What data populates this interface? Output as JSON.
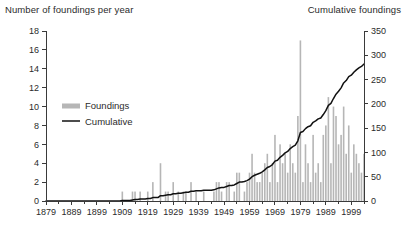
{
  "header": {
    "left_title": "Number of foundings per year",
    "right_title": "Cumulative foundings"
  },
  "legend": {
    "items": [
      {
        "label": "Foundings",
        "type": "bar",
        "color": "#b6b6b6"
      },
      {
        "label": "Cumulative",
        "type": "line",
        "color": "#111111"
      }
    ]
  },
  "chart_data": {
    "type": "bar",
    "title": "",
    "subtitle": "",
    "xlabel": "",
    "ylabel": "Number of foundings per year",
    "y2label": "Cumulative foundings",
    "grid": false,
    "legend_position": "inside-left",
    "ylim": [
      0,
      18
    ],
    "y2lim": [
      0,
      350
    ],
    "yticks": [
      0,
      2,
      4,
      6,
      8,
      10,
      12,
      14,
      16,
      18
    ],
    "ytick_labels": [
      "0",
      "2",
      "4",
      "6",
      "8",
      "10",
      "12",
      "14",
      "16",
      "18"
    ],
    "y2ticks": [
      0,
      50,
      100,
      150,
      200,
      250,
      300,
      350
    ],
    "y2tick_labels": [
      "0",
      "50",
      "100",
      "150",
      "200",
      "250",
      "300",
      "350"
    ],
    "xlim": [
      1879,
      2004
    ],
    "xticks": [
      1879,
      1889,
      1899,
      1909,
      1919,
      1929,
      1939,
      1949,
      1959,
      1969,
      1979,
      1989,
      1999
    ],
    "xtick_labels": [
      "1879",
      "1889",
      "1899",
      "1909",
      "1919",
      "1929",
      "1939",
      "1949",
      "1959",
      "1969",
      "1979",
      "1989",
      "1999"
    ],
    "minor_xtick_step": 5,
    "x": [
      1879,
      1880,
      1881,
      1882,
      1883,
      1884,
      1885,
      1886,
      1887,
      1888,
      1889,
      1890,
      1891,
      1892,
      1893,
      1894,
      1895,
      1896,
      1897,
      1898,
      1899,
      1900,
      1901,
      1902,
      1903,
      1904,
      1905,
      1906,
      1907,
      1908,
      1909,
      1910,
      1911,
      1912,
      1913,
      1914,
      1915,
      1916,
      1917,
      1918,
      1919,
      1920,
      1921,
      1922,
      1923,
      1924,
      1925,
      1926,
      1927,
      1928,
      1929,
      1930,
      1931,
      1932,
      1933,
      1934,
      1935,
      1936,
      1937,
      1938,
      1939,
      1940,
      1941,
      1942,
      1943,
      1944,
      1945,
      1946,
      1947,
      1948,
      1949,
      1950,
      1951,
      1952,
      1953,
      1954,
      1955,
      1956,
      1957,
      1958,
      1959,
      1960,
      1961,
      1962,
      1963,
      1964,
      1965,
      1966,
      1967,
      1968,
      1969,
      1970,
      1971,
      1972,
      1973,
      1974,
      1975,
      1976,
      1977,
      1978,
      1979,
      1980,
      1981,
      1982,
      1983,
      1984,
      1985,
      1986,
      1987,
      1988,
      1989,
      1990,
      1991,
      1992,
      1993,
      1994,
      1995,
      1996,
      1997,
      1998,
      1999,
      2000,
      2001,
      2002,
      2003,
      2004
    ],
    "series": [
      {
        "name": "Foundings",
        "kind": "bar",
        "axis": "left",
        "color": "#b6b6b6",
        "values": [
          0,
          0,
          0,
          0,
          0,
          0,
          0,
          0,
          0,
          0,
          0,
          0,
          0,
          0,
          0,
          0,
          0,
          0,
          0,
          0,
          0,
          0,
          0,
          0,
          0,
          0,
          0,
          0,
          0,
          0,
          1,
          0,
          0,
          0,
          1,
          1,
          0,
          1,
          0,
          0,
          1,
          0,
          2,
          0,
          0,
          4,
          0,
          1,
          1,
          0,
          2,
          0,
          1,
          0,
          1,
          1,
          0,
          2,
          0,
          1,
          0,
          0,
          1,
          0,
          0,
          0,
          1,
          2,
          2,
          1,
          0,
          2,
          2,
          0,
          1,
          3,
          3,
          0,
          1,
          2,
          3,
          5,
          3,
          2,
          2,
          3,
          4,
          5,
          2,
          4,
          7,
          2,
          6,
          4,
          5,
          3,
          6,
          4,
          3,
          9,
          17,
          2,
          6,
          4,
          2,
          7,
          3,
          4,
          2,
          7,
          8,
          11,
          4,
          10,
          9,
          6,
          7,
          10,
          5,
          8,
          3,
          6,
          5,
          4,
          3,
          5
        ]
      },
      {
        "name": "Cumulative",
        "kind": "line",
        "axis": "right",
        "color": "#111111",
        "values": [
          0,
          0,
          0,
          0,
          0,
          0,
          0,
          0,
          0,
          0,
          0,
          0,
          0,
          0,
          0,
          0,
          0,
          0,
          0,
          0,
          0,
          0,
          0,
          0,
          0,
          0,
          0,
          0,
          0,
          0,
          1,
          1,
          1,
          1,
          2,
          3,
          3,
          4,
          4,
          4,
          5,
          5,
          7,
          7,
          7,
          11,
          11,
          12,
          13,
          13,
          15,
          15,
          16,
          16,
          17,
          18,
          18,
          20,
          20,
          21,
          21,
          21,
          22,
          22,
          22,
          22,
          23,
          25,
          27,
          28,
          28,
          30,
          32,
          32,
          33,
          36,
          39,
          39,
          40,
          42,
          45,
          50,
          53,
          55,
          57,
          60,
          64,
          69,
          71,
          75,
          82,
          84,
          90,
          94,
          99,
          102,
          108,
          112,
          115,
          124,
          141,
          143,
          149,
          153,
          155,
          162,
          165,
          169,
          171,
          178,
          186,
          197,
          201,
          211,
          220,
          226,
          233,
          243,
          248,
          256,
          259,
          265,
          270,
          274,
          277,
          282
        ]
      }
    ]
  }
}
